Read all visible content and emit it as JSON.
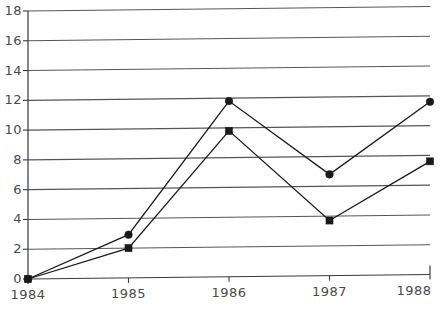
{
  "chart_data": {
    "type": "line",
    "title": "",
    "subtitle": "",
    "xlabel": "",
    "ylabel": "",
    "categories": [
      "1984",
      "1985",
      "1986",
      "1987",
      "1988"
    ],
    "x": [
      1984,
      1985,
      1986,
      1987,
      1988
    ],
    "xlim": [
      1984,
      1988
    ],
    "ylim": [
      0,
      18
    ],
    "yticks": [
      0,
      2,
      4,
      6,
      8,
      10,
      12,
      14,
      16,
      18
    ],
    "ytick_labels": [
      "0",
      "2",
      "4",
      "6",
      "8",
      "10",
      "12",
      "14",
      "16",
      "18"
    ],
    "xtick_labels": [
      "1984",
      "1985",
      "1986",
      "1987",
      "1988"
    ],
    "grid": "horizontal",
    "legend": "none",
    "series": [
      {
        "name": "series-1",
        "marker": "circle",
        "color": "#1a1a1a",
        "values": [
          0.0,
          2.9,
          11.8,
          6.8,
          11.6
        ]
      },
      {
        "name": "series-2",
        "marker": "square",
        "color": "#1a1a1a",
        "values": [
          0.0,
          2.0,
          9.8,
          3.7,
          7.6
        ]
      }
    ],
    "annotations": []
  },
  "style": {
    "grid_color": "#555555",
    "axis_color": "#3a3a3a",
    "label_color": "#4a4a4a",
    "background": "#ffffff"
  }
}
